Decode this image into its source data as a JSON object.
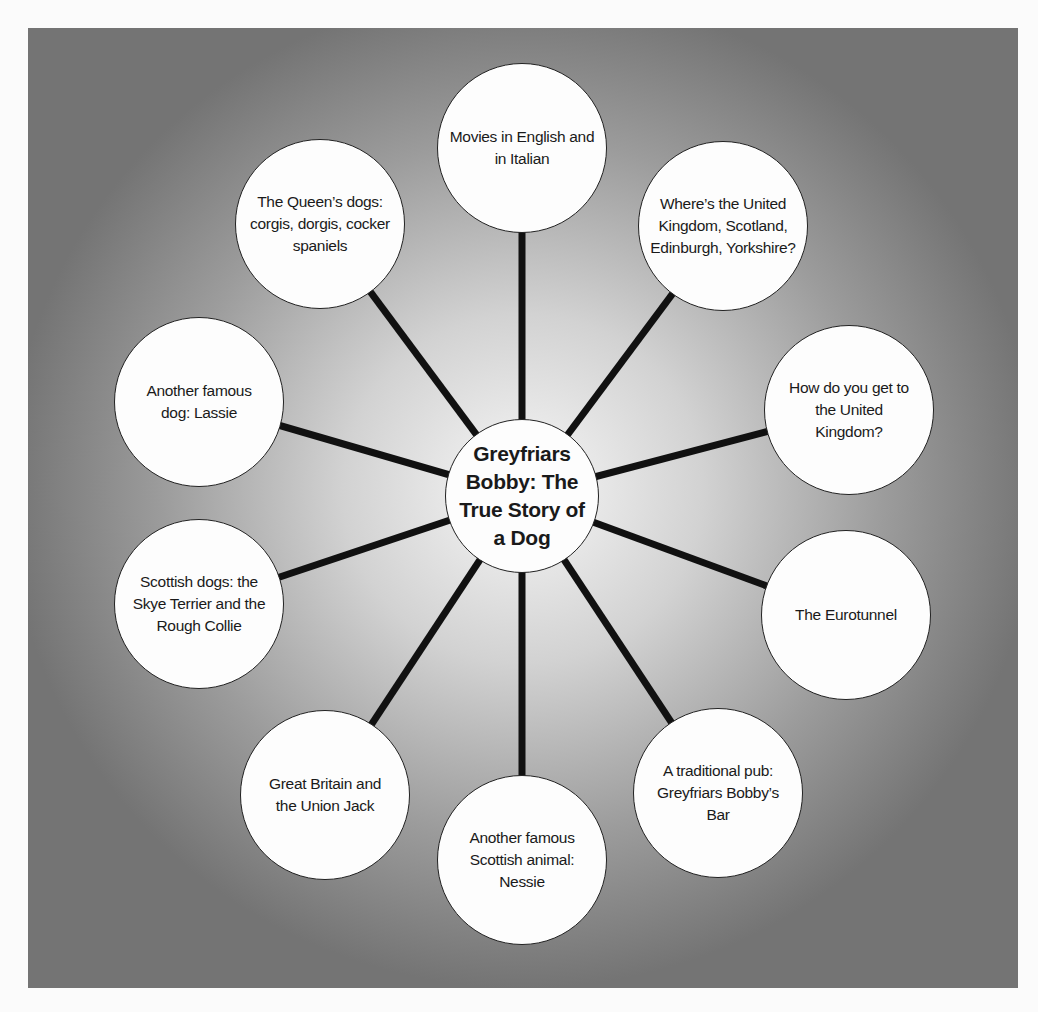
{
  "diagram": {
    "type": "spider mind map",
    "center": {
      "label": "Greyfriars Bobby: The True Story of a Dog",
      "x": 522,
      "y": 496,
      "r": 77
    },
    "line_color": "#111111",
    "nodes": [
      {
        "label": "Movies in English and in Italian",
        "x": 522,
        "y": 148
      },
      {
        "label": "Where’s the United Kingdom, Scotland, Edinburgh, Yorkshire?",
        "x": 723,
        "y": 226
      },
      {
        "label": "How do you get to the United Kingdom?",
        "x": 849,
        "y": 410
      },
      {
        "label": "The Eurotunnel",
        "x": 846,
        "y": 615
      },
      {
        "label": "A traditional pub: Greyfriars Bobby’s Bar",
        "x": 718,
        "y": 793
      },
      {
        "label": "Another famous Scottish animal: Nessie",
        "x": 522,
        "y": 860
      },
      {
        "label": "Great Britain and the Union Jack",
        "x": 325,
        "y": 795
      },
      {
        "label": "Scottish dogs: the Skye Terrier and the Rough Collie",
        "x": 199,
        "y": 604
      },
      {
        "label": "Another famous dog: Lassie",
        "x": 199,
        "y": 402
      },
      {
        "label": "The Queen’s dogs: corgis, dorgis, cocker spaniels",
        "x": 320,
        "y": 224
      }
    ],
    "node_radius": 85
  }
}
